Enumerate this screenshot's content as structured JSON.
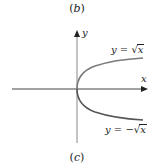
{
  "figure": {
    "top_caption": "(b)",
    "bottom_caption": "(c)",
    "axes": {
      "x_label": "x",
      "y_label": "y"
    },
    "curves": [
      {
        "name": "upper-branch",
        "equation_lhs": "y = ",
        "equation_sign": "",
        "equation_radicand": "x",
        "color": "#7a7a7a"
      },
      {
        "name": "lower-branch",
        "equation_lhs": "y = ",
        "equation_sign": "−",
        "equation_radicand": "x",
        "color": "#555555"
      }
    ],
    "colors": {
      "axis": "#444444",
      "background": "#ffffff"
    }
  }
}
